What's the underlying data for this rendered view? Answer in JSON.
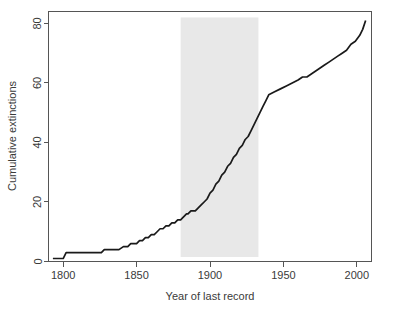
{
  "chart_data": {
    "type": "line",
    "title": "",
    "xlabel": "Year of last record",
    "ylabel": "Cumulative extinctions",
    "xlim": [
      1790,
      2010
    ],
    "ylim": [
      0,
      84
    ],
    "xticks": [
      1800,
      1850,
      1900,
      1950,
      2000
    ],
    "xticklabels": [
      "1800",
      "1850",
      "1900",
      "1950",
      "2000"
    ],
    "yticks": [
      0,
      20,
      40,
      60,
      80
    ],
    "yticklabels": [
      "0",
      "20",
      "40",
      "60",
      "80"
    ],
    "grid": false,
    "legend": null,
    "line_color": "#1a1a1a",
    "band_color": "#e8e8e8",
    "annotations": [
      {
        "type": "vertical-band",
        "name": "highlight-band",
        "x_start": 1880,
        "x_end": 1933,
        "y_start": 1.5,
        "y_end": 82,
        "color": "#e8e8e8"
      }
    ],
    "series": [
      {
        "name": "Cumulative extinctions",
        "color": "#1a1a1a",
        "x": [
          1793,
          1796,
          1800,
          1801,
          1802,
          1826,
          1828,
          1832,
          1834,
          1838,
          1841,
          1844,
          1846,
          1848,
          1850,
          1852,
          1854,
          1856,
          1858,
          1860,
          1862,
          1864,
          1866,
          1868,
          1870,
          1872,
          1874,
          1876,
          1878,
          1880,
          1882,
          1884,
          1885,
          1887,
          1888,
          1890,
          1892,
          1894,
          1896,
          1898,
          1900,
          1902,
          1904,
          1906,
          1908,
          1910,
          1912,
          1914,
          1916,
          1918,
          1920,
          1922,
          1924,
          1926,
          1928,
          1930,
          1932,
          1934,
          1936,
          1938,
          1940,
          1944,
          1948,
          1952,
          1956,
          1960,
          1963,
          1966,
          1969,
          1972,
          1975,
          1978,
          1981,
          1984,
          1987,
          1990,
          1993,
          1996,
          1999,
          2002,
          2004,
          2006
        ],
        "y": [
          1,
          1,
          1,
          2,
          3,
          3,
          4,
          4,
          4,
          4,
          5,
          5,
          6,
          6,
          6,
          7,
          7,
          8,
          8,
          9,
          9,
          10,
          11,
          11,
          12,
          12,
          13,
          13,
          14,
          14,
          15,
          16,
          16,
          17,
          17,
          17,
          18,
          19,
          20,
          21,
          23,
          24,
          26,
          27,
          29,
          30,
          32,
          33,
          35,
          36,
          38,
          39,
          41,
          42,
          44,
          46,
          48,
          50,
          52,
          54,
          56,
          57,
          58,
          59,
          60,
          61,
          62,
          62,
          63,
          64,
          65,
          66,
          67,
          68,
          69,
          70,
          71,
          73,
          74,
          76,
          78,
          81
        ]
      }
    ]
  }
}
